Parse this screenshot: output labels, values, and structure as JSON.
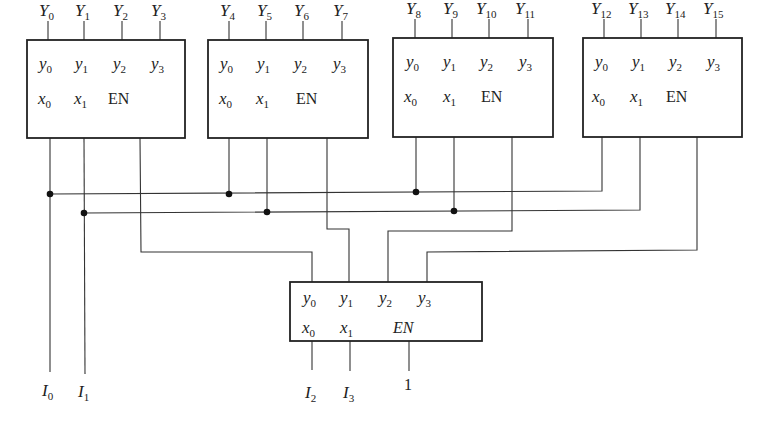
{
  "diagram": {
    "decoders_top": [
      {
        "id": "decoder-0",
        "outputs": [
          {
            "base": "Y",
            "sub": "0"
          },
          {
            "base": "Y",
            "sub": "1"
          },
          {
            "base": "Y",
            "sub": "2"
          },
          {
            "base": "Y",
            "sub": "3"
          }
        ],
        "pins_out": [
          {
            "base": "y",
            "sub": "0"
          },
          {
            "base": "y",
            "sub": "1"
          },
          {
            "base": "y",
            "sub": "2"
          },
          {
            "base": "y",
            "sub": "3"
          }
        ],
        "pins_in": [
          {
            "base": "x",
            "sub": "0"
          },
          {
            "base": "x",
            "sub": "1"
          }
        ],
        "enable": "EN"
      },
      {
        "id": "decoder-1",
        "outputs": [
          {
            "base": "Y",
            "sub": "4"
          },
          {
            "base": "Y",
            "sub": "5"
          },
          {
            "base": "Y",
            "sub": "6"
          },
          {
            "base": "Y",
            "sub": "7"
          }
        ],
        "pins_out": [
          {
            "base": "y",
            "sub": "0"
          },
          {
            "base": "y",
            "sub": "1"
          },
          {
            "base": "y",
            "sub": "2"
          },
          {
            "base": "y",
            "sub": "3"
          }
        ],
        "pins_in": [
          {
            "base": "x",
            "sub": "0"
          },
          {
            "base": "x",
            "sub": "1"
          }
        ],
        "enable": "EN"
      },
      {
        "id": "decoder-2",
        "outputs": [
          {
            "base": "Y",
            "sub": "8"
          },
          {
            "base": "Y",
            "sub": "9"
          },
          {
            "base": "Y",
            "sub": "10"
          },
          {
            "base": "Y",
            "sub": "11"
          }
        ],
        "pins_out": [
          {
            "base": "y",
            "sub": "0"
          },
          {
            "base": "y",
            "sub": "1"
          },
          {
            "base": "y",
            "sub": "2"
          },
          {
            "base": "y",
            "sub": "3"
          }
        ],
        "pins_in": [
          {
            "base": "x",
            "sub": "0"
          },
          {
            "base": "x",
            "sub": "1"
          }
        ],
        "enable": "EN"
      },
      {
        "id": "decoder-3",
        "outputs": [
          {
            "base": "Y",
            "sub": "12"
          },
          {
            "base": "Y",
            "sub": "13"
          },
          {
            "base": "Y",
            "sub": "14"
          },
          {
            "base": "Y",
            "sub": "15"
          }
        ],
        "pins_out": [
          {
            "base": "y",
            "sub": "0"
          },
          {
            "base": "y",
            "sub": "1"
          },
          {
            "base": "y",
            "sub": "2"
          },
          {
            "base": "y",
            "sub": "3"
          }
        ],
        "pins_in": [
          {
            "base": "x",
            "sub": "0"
          },
          {
            "base": "x",
            "sub": "1"
          }
        ],
        "enable": "EN"
      }
    ],
    "decoder_bottom": {
      "id": "decoder-select",
      "pins_out": [
        {
          "base": "y",
          "sub": "0"
        },
        {
          "base": "y",
          "sub": "1"
        },
        {
          "base": "y",
          "sub": "2"
        },
        {
          "base": "y",
          "sub": "3"
        }
      ],
      "pins_in": [
        {
          "base": "x",
          "sub": "0"
        },
        {
          "base": "x",
          "sub": "1"
        }
      ],
      "enable": "EN"
    },
    "inputs": [
      {
        "base": "I",
        "sub": "0"
      },
      {
        "base": "I",
        "sub": "1"
      },
      {
        "base": "I",
        "sub": "2"
      },
      {
        "base": "I",
        "sub": "3"
      }
    ],
    "enable_constant": "1"
  }
}
